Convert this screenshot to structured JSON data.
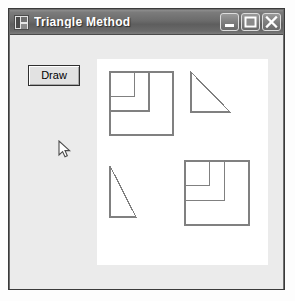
{
  "window": {
    "title": "Triangle Method",
    "icon": "application-window-icon",
    "controls": [
      {
        "name": "minimize",
        "label": "Minimize",
        "glyph": "minimize-icon"
      },
      {
        "name": "maximize",
        "label": "Maximize",
        "glyph": "maximize-icon"
      },
      {
        "name": "close",
        "label": "Close",
        "glyph": "close-icon"
      }
    ]
  },
  "form": {
    "draw_button_label": "Draw",
    "background_color": "#ebebeb",
    "canvas_background_color": "#ffffff",
    "stroke_color": "#808080"
  },
  "canvas": {
    "width": 171,
    "height": 206,
    "shapes": [
      {
        "name": "recursive-squares-top-left",
        "type": "recursive-square",
        "origin_x": 13,
        "origin_y": 13,
        "size": 63,
        "levels": 3,
        "ratio": 0.62
      },
      {
        "name": "right-triangle-top-right",
        "type": "right-triangle",
        "points": "94,13 94,53 133,53",
        "right_angle": "bottom-left",
        "width": 39,
        "height": 40
      },
      {
        "name": "narrow-triangle-bottom-left",
        "type": "right-triangle",
        "points": "13,107 13,158 39,158",
        "right_angle": "bottom-left",
        "width": 26,
        "height": 51
      },
      {
        "name": "recursive-squares-bottom-right",
        "type": "recursive-square",
        "origin_x": 88,
        "origin_y": 102,
        "size": 64,
        "levels": 3,
        "ratio": 0.62
      }
    ]
  },
  "cursor": {
    "name": "mouse-pointer",
    "x": 48,
    "y": 105
  },
  "caption": {
    "text": ""
  }
}
